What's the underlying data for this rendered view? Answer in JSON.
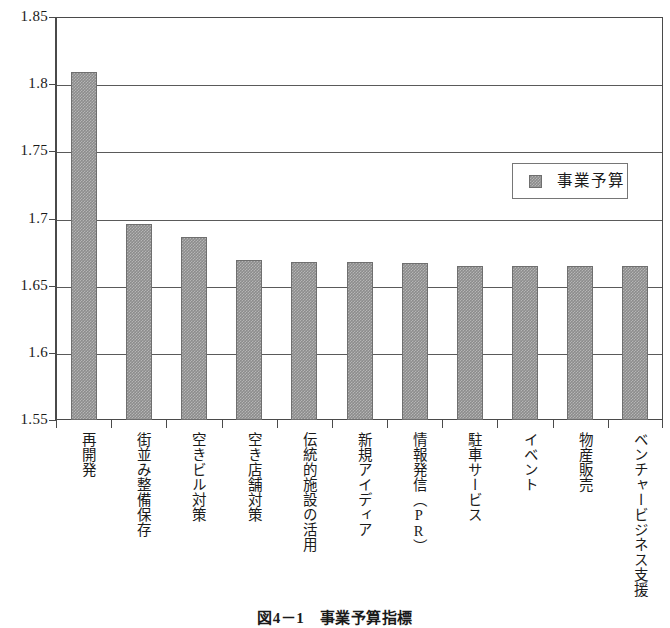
{
  "caption": "図4－1　事業予算指標",
  "legend": {
    "entries": [
      {
        "label": "事業予算",
        "color": "#8c8c8c",
        "swatch": "filled-square-icon"
      }
    ]
  },
  "axis": {
    "y_ticks": [
      "1.85",
      "1.8",
      "1.75",
      "1.7",
      "1.65",
      "1.6",
      "1.55"
    ]
  },
  "chart_data": {
    "type": "bar",
    "title": "図4－1　事業予算指標",
    "xlabel": "",
    "ylabel": "",
    "ylim": [
      1.55,
      1.85
    ],
    "ytick_values": [
      1.85,
      1.8,
      1.75,
      1.7,
      1.65,
      1.6,
      1.55
    ],
    "grid": true,
    "legend_position": "inside-right",
    "bar_color": "#8c8c8c",
    "categories": [
      "再開発",
      "街並み整備保存",
      "空きビル対策",
      "空き店舗対策",
      "伝統的施設の活用",
      "新規アイディア",
      "情報発信（PR）",
      "駐車サービス",
      "イベント",
      "物産販売",
      "ベンチャービジネス支援"
    ],
    "series": [
      {
        "name": "事業予算",
        "values": [
          1.809,
          1.696,
          1.686,
          1.669,
          1.668,
          1.668,
          1.667,
          1.665,
          1.665,
          1.665,
          1.665
        ]
      }
    ]
  }
}
